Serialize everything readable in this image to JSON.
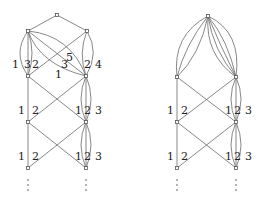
{
  "figure": {
    "left_graph": {
      "edge_labels": {
        "upper_left_outer": "1",
        "upper_left_mid": "3",
        "upper_left_inner": "2",
        "upper_cross_5": "5",
        "upper_cross_3": "3",
        "upper_cross_1": "1",
        "upper_right_inner": "2",
        "upper_right_outer": "4",
        "row2_left_1": "1",
        "row2_left_2": "2",
        "row2_right_1": "1",
        "row2_right_2": "2",
        "row2_right_3": "3",
        "row3_left_1": "1",
        "row3_left_2": "2",
        "row3_right_1": "1",
        "row3_right_2": "2",
        "row3_right_3": "3"
      },
      "continuation": "⋮"
    },
    "right_graph": {
      "edge_labels": {
        "row2_left_1": "1",
        "row2_left_2": "2",
        "row2_right_1": "1",
        "row2_right_2": "2",
        "row2_right_3": "3",
        "row3_left_1": "1",
        "row3_left_2": "2",
        "row3_right_1": "1",
        "row3_right_2": "2",
        "row3_right_3": "3"
      },
      "continuation": "⋮"
    },
    "colors": {
      "edge": "#6a6a6a",
      "node": "#555555",
      "text": "#222222"
    }
  }
}
